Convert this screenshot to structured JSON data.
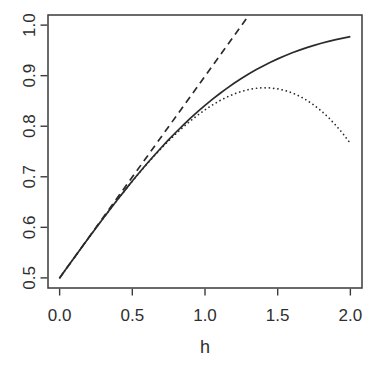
{
  "chart_data": {
    "type": "line",
    "title": "",
    "xlabel": "h",
    "ylabel": "",
    "xlim": [
      0.0,
      2.0
    ],
    "ylim": [
      0.5,
      1.0
    ],
    "axis_usr_x": [
      -0.08,
      2.08
    ],
    "axis_usr_y": [
      0.48,
      1.02
    ],
    "grid": false,
    "legend": "none",
    "line_color": "#2b2b2b",
    "frame_color": "#3a3a3a",
    "x_ticks": {
      "values": [
        0.0,
        0.5,
        1.0,
        1.5,
        2.0
      ],
      "labels": [
        "0.0",
        "0.5",
        "1.0",
        "1.5",
        "2.0"
      ]
    },
    "y_ticks": {
      "values": [
        0.5,
        0.6,
        0.7,
        0.8,
        0.9,
        1.0
      ],
      "labels": [
        "0.5",
        "0.6",
        "0.7",
        "0.8",
        "0.9",
        "1.0"
      ]
    },
    "x": [
      0,
      0.05,
      0.1,
      0.15,
      0.2,
      0.25,
      0.3,
      0.35,
      0.4,
      0.45,
      0.5,
      0.55,
      0.6,
      0.65,
      0.7,
      0.75,
      0.8,
      0.85,
      0.9,
      0.95,
      1.0,
      1.05,
      1.1,
      1.15,
      1.2,
      1.25,
      1.3,
      1.35,
      1.4,
      1.45,
      1.5,
      1.55,
      1.6,
      1.65,
      1.7,
      1.75,
      1.8,
      1.85,
      1.9,
      1.95,
      2.0
    ],
    "series": [
      {
        "name": "solid-curve",
        "style": "solid",
        "values": [
          0.5,
          0.5199,
          0.5398,
          0.5596,
          0.5793,
          0.5987,
          0.6179,
          0.6368,
          0.6554,
          0.6736,
          0.6915,
          0.7088,
          0.7257,
          0.7422,
          0.758,
          0.7734,
          0.7881,
          0.8023,
          0.8159,
          0.8289,
          0.8413,
          0.8531,
          0.8643,
          0.8749,
          0.8849,
          0.8944,
          0.9032,
          0.9115,
          0.9192,
          0.9265,
          0.9332,
          0.9394,
          0.9452,
          0.9505,
          0.9554,
          0.9599,
          0.9641,
          0.9678,
          0.9713,
          0.9744,
          0.9772
        ]
      },
      {
        "name": "dashed-line",
        "style": "dashed",
        "x": [
          0,
          1.3033
        ],
        "values": [
          0.5,
          1.02
        ]
      },
      {
        "name": "dotted-curve",
        "style": "dotted",
        "values": [
          0.5,
          0.5199,
          0.5398,
          0.5596,
          0.5793,
          0.5987,
          0.6179,
          0.6368,
          0.6553,
          0.6735,
          0.6912,
          0.7083,
          0.725,
          0.7411,
          0.7564,
          0.7712,
          0.7851,
          0.7983,
          0.8106,
          0.822,
          0.8324,
          0.8419,
          0.8503,
          0.8576,
          0.8638,
          0.8688,
          0.8725,
          0.875,
          0.8761,
          0.8758,
          0.874,
          0.8707,
          0.866,
          0.8595,
          0.8515,
          0.8417,
          0.8303,
          0.8171,
          0.8019,
          0.7849,
          0.766
        ]
      }
    ]
  }
}
